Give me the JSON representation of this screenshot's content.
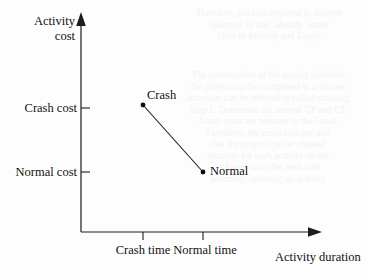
{
  "figure": {
    "y_axis": {
      "title_line1": "Activity",
      "title_line2": "cost",
      "ticks": [
        {
          "label": "Crash cost",
          "value": "crash-cost"
        },
        {
          "label": "Normal cost",
          "value": "normal-cost"
        }
      ]
    },
    "x_axis": {
      "title": "Activity duration",
      "ticks": [
        {
          "label": "Crash time",
          "value": "crash-time"
        },
        {
          "label": "Normal time",
          "value": "normal-time"
        }
      ]
    },
    "points": [
      {
        "label": "Crash",
        "x": "Crash time",
        "y": "Crash cost"
      },
      {
        "label": "Normal",
        "x": "Normal time",
        "y": "Normal cost"
      }
    ]
  },
  "bleed_text": {
    "top_right_block": "Therefore, the cost required to achieve\nhowever, in this  already  under\nHow to Identify and Target",
    "mid_right_block": "The construction of the project schedule\nthe project can be completed in a shorter\nactivities can be reduced is called crashing\nStep 1: Determine the normal CP and CT\nCrash costs are reduced to the Crash\nTherefore, the crash cost per unit\nthat the project can be crashed\nduration for each activity on the\nis found to be the least cost\nnormally, selecting an activity"
  },
  "colors": {
    "ink": "#1c1c1c",
    "paper": "#fdfdfd",
    "bleed": "#f2f3f5"
  }
}
